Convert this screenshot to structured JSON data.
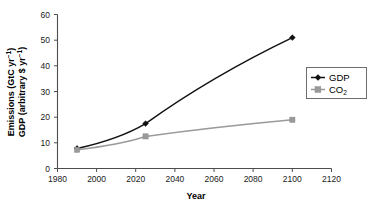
{
  "chart_data": {
    "type": "line",
    "title": "",
    "xlabel": "Year",
    "ylabel_line1": "Emissions (GtC yr⁻¹)",
    "ylabel_line2": "GDP (arbitrary $ yr⁻¹)",
    "xlim": [
      1980,
      2120
    ],
    "ylim": [
      0,
      60
    ],
    "xticks": [
      1980,
      2000,
      2020,
      2040,
      2060,
      2080,
      2100,
      2120
    ],
    "xtick_labels": [
      "1980",
      "2000",
      "2020",
      "2040",
      "2060",
      "2080",
      "2100",
      "2120"
    ],
    "yticks": [
      0,
      10,
      20,
      30,
      40,
      50,
      60
    ],
    "ytick_labels": [
      "0",
      "10",
      "20",
      "30",
      "40",
      "50",
      "60"
    ],
    "grid": false,
    "legend_position": "right",
    "series": [
      {
        "name": "GDP",
        "color": "#111111",
        "marker": "diamond",
        "x": [
          1990,
          2025,
          2100
        ],
        "values": [
          7.8,
          17.5,
          51.0
        ]
      },
      {
        "name": "CO2",
        "color": "#9a9a9a",
        "marker": "square",
        "x": [
          1990,
          2025,
          2100
        ],
        "values": [
          7.3,
          12.5,
          19.0
        ]
      }
    ]
  },
  "legend": {
    "entries": [
      {
        "label": "GDP",
        "label_main": "GDP",
        "label_sub": ""
      },
      {
        "label": "CO2",
        "label_main": "CO",
        "label_sub": "2"
      }
    ]
  },
  "axis": {
    "x_title": "Year",
    "y_title_line1_main": "Emissions (GtC yr",
    "y_title_line1_sup": "−1",
    "y_title_line1_tail": ")",
    "y_title_line2_main": "GDP (arbitrary $ yr",
    "y_title_line2_sup": "−1",
    "y_title_line2_tail": ")"
  }
}
